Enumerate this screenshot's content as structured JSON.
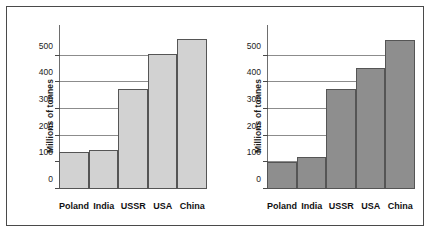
{
  "figure": {
    "panels": [
      {
        "id": "left-chart",
        "name": "left-bar-chart",
        "bar_fill": "#d2d2d2",
        "bar_stroke": "#555555",
        "chart_data": {
          "type": "bar",
          "title": "",
          "xlabel": "",
          "ylabel": "Millions of tonnes",
          "categories": [
            "Poland",
            "India",
            "USSR",
            "USA",
            "China"
          ],
          "values": [
            140,
            148,
            375,
            508,
            562
          ],
          "ylim": [
            0,
            600
          ],
          "yticks": [
            0,
            100,
            200,
            300,
            400,
            500
          ],
          "ytick_labels": [
            "0",
            "100",
            "200",
            "300",
            "400",
            "500"
          ],
          "grid": true,
          "legend": "none"
        }
      },
      {
        "id": "right-chart",
        "name": "right-bar-chart",
        "bar_fill": "#8e8e8e",
        "bar_stroke": "#555555",
        "chart_data": {
          "type": "bar",
          "title": "",
          "xlabel": "",
          "ylabel": "Millions of tonnes",
          "categories": [
            "Poland",
            "India",
            "USSR",
            "USA",
            "China"
          ],
          "values": [
            100,
            120,
            375,
            452,
            557
          ],
          "ylim": [
            0,
            600
          ],
          "yticks": [
            0,
            100,
            200,
            300,
            400,
            500
          ],
          "ytick_labels": [
            "0",
            "100",
            "200",
            "300",
            "400",
            "500"
          ],
          "grid": true,
          "legend": "none"
        }
      }
    ]
  },
  "chart_data": [
    {
      "type": "bar",
      "title": "",
      "xlabel": "",
      "ylabel": "Millions of tonnes",
      "categories": [
        "Poland",
        "India",
        "USSR",
        "USA",
        "China"
      ],
      "values": [
        140,
        148,
        375,
        508,
        562
      ],
      "ylim": [
        0,
        600
      ],
      "yticks": [
        0,
        100,
        200,
        300,
        400,
        500
      ],
      "grid": true
    },
    {
      "type": "bar",
      "title": "",
      "xlabel": "",
      "ylabel": "Millions of tonnes",
      "categories": [
        "Poland",
        "India",
        "USSR",
        "USA",
        "China"
      ],
      "values": [
        100,
        120,
        375,
        452,
        557
      ],
      "ylim": [
        0,
        600
      ],
      "yticks": [
        0,
        100,
        200,
        300,
        400,
        500
      ],
      "grid": true
    }
  ]
}
